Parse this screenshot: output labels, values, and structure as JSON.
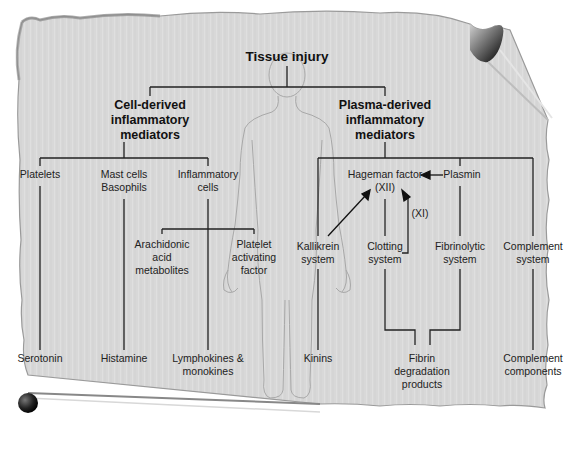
{
  "diagram": {
    "root": {
      "label": "Tissue injury"
    },
    "branches": [
      {
        "title": [
          "Cell-derived",
          "inflammatory",
          "mediators"
        ],
        "sources": [
          {
            "label": [
              "Platelets"
            ],
            "product": [
              "Serotonin"
            ]
          },
          {
            "label": [
              "Mast cells",
              "Basophils"
            ],
            "product": [
              "Histamine"
            ]
          },
          {
            "label": [
              "Inflammatory",
              "cells"
            ],
            "product": [
              "Lymphokines &",
              "monokines"
            ]
          }
        ],
        "sub_mediators": [
          {
            "label": [
              "Arachidonic",
              "acid",
              "metabolites"
            ]
          },
          {
            "label": [
              "Platelet",
              "activating",
              "factor"
            ]
          }
        ]
      },
      {
        "title": [
          "Plasma-derived",
          "inflammatory",
          "mediators"
        ],
        "hageman": {
          "label": [
            "Hageman factor",
            "(XII)"
          ]
        },
        "plasmin": {
          "label": "Plasmin"
        },
        "xi_label": "(XI)",
        "systems": [
          {
            "label": [
              "Kallikrein",
              "system"
            ],
            "product": [
              "Kinins"
            ]
          },
          {
            "label": [
              "Clotting",
              "system"
            ]
          },
          {
            "label": [
              "Fibrinolytic",
              "system"
            ]
          },
          {
            "label": [
              "Complement",
              "system"
            ],
            "product": [
              "Complement",
              "components"
            ]
          }
        ],
        "shared_product": {
          "label": [
            "Fibrin",
            "degradation",
            "products"
          ]
        }
      }
    ],
    "colors": {
      "paper": "#d9d9d9",
      "paper_shadow": "#9a9a9a",
      "line": "#222222",
      "body_outline": "#a8a8a8",
      "curl": "#111111"
    }
  }
}
